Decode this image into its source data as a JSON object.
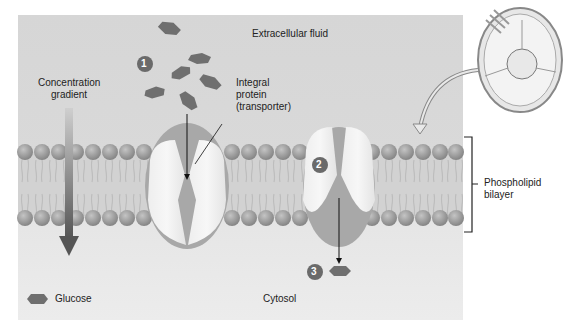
{
  "diagram": {
    "regions": {
      "extracellular": "Extracellular fluid",
      "cytosol": "Cytosol"
    },
    "labels": {
      "gradient_line1": "Concentration",
      "gradient_line2": "gradient",
      "protein_line1": "Integral",
      "protein_line2": "protein",
      "protein_line3": "(transporter)",
      "bilayer_line1": "Phospholipid",
      "bilayer_line2": "bilayer"
    },
    "legend": {
      "glucose_label": "Glucose",
      "glucose_icon": "hexagon-icon"
    },
    "steps": [
      {
        "number": "1"
      },
      {
        "number": "2"
      },
      {
        "number": "3"
      }
    ],
    "inset": {
      "description": "cell-icon"
    },
    "colors": {
      "background": "#d8d8d8",
      "glucose": "#6f6f6f",
      "step_badge": "#6a6a6a",
      "phospholipid_head": "#9a9a9a"
    }
  }
}
